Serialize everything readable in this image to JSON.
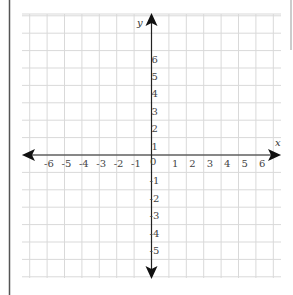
{
  "diagram": {
    "type": "coordinate-plane",
    "x_axis": {
      "name": "x",
      "min": -6,
      "max": 6,
      "tick_labels": [
        "-6",
        "-5",
        "-4",
        "-3",
        "-2",
        "-1",
        "1",
        "2",
        "3",
        "4",
        "5",
        "6"
      ]
    },
    "y_axis": {
      "name": "y",
      "min": -5,
      "max": 6,
      "tick_labels_positive": [
        "1",
        "2",
        "3",
        "4",
        "5",
        "6"
      ],
      "tick_labels_negative": [
        "-1",
        "-2",
        "-3",
        "-4",
        "-5"
      ]
    },
    "origin_label": "0",
    "colors": {
      "grid": "#d9d9d9",
      "axis": "#222222",
      "border": "#555555",
      "background": "#ffffff"
    }
  }
}
